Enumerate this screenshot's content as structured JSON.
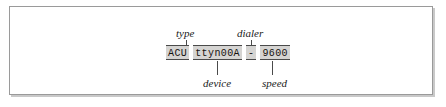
{
  "figure": {
    "code_line": {
      "fields": [
        {
          "id": "type",
          "value": "ACU"
        },
        {
          "id": "device",
          "value": "ttyn00A"
        },
        {
          "id": "dialer",
          "value": "-"
        },
        {
          "id": "speed",
          "value": "9600"
        }
      ],
      "full_text": "ACU ttyn00A - 9600"
    },
    "callouts": {
      "type": "type",
      "device": "device",
      "dialer": "dialer",
      "speed": "speed"
    },
    "colors": {
      "field_shading": "#d5d4d2",
      "field_rule": "#4a4a4a",
      "frame_border": "#9a9a9a",
      "frame_shadow": "#c9c9c9",
      "text": "#15120f",
      "background": "#ffffff"
    }
  }
}
